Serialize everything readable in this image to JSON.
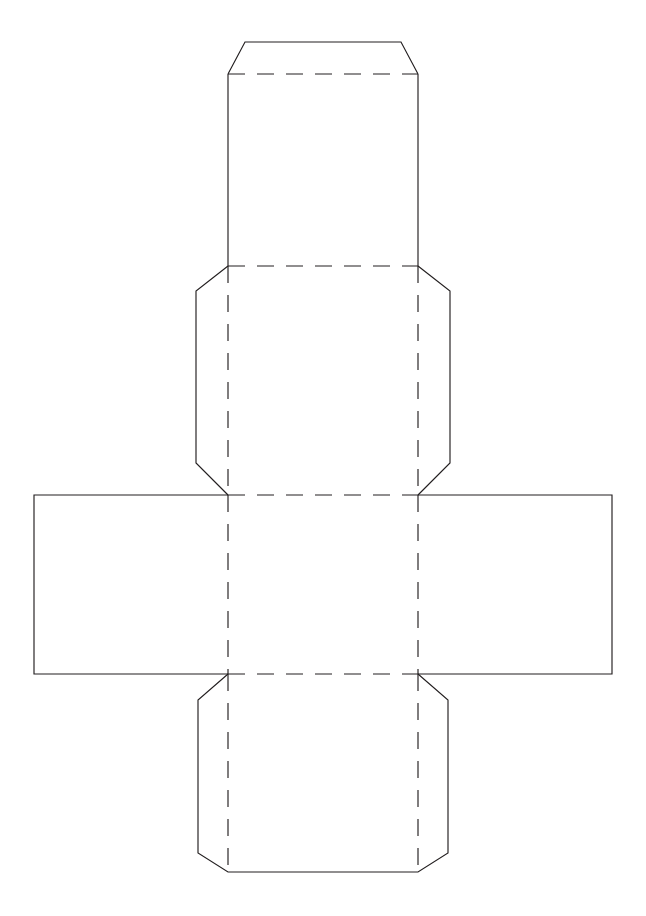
{
  "document": {
    "title": "Cube Box Papercraft Template",
    "kind": "printable-craft-net",
    "page": {
      "width": 646,
      "height": 916,
      "background": "#ffffff"
    }
  },
  "style": {
    "cut_line_color": "#231f20",
    "fold_line_color": "#231f20",
    "line_width": 1.15,
    "fold_dash_pattern": "17 12",
    "face_fill": "#ffffff"
  },
  "legend": {
    "cut_label": "Cut line (solid)",
    "fold_label": "Fold line (dashed)"
  },
  "geometry": {
    "center_column": {
      "left": 228,
      "right": 418,
      "width": 190
    },
    "middle_row": {
      "top": 495,
      "bottom": 674,
      "height": 179
    },
    "chamfer": 32
  },
  "panels": [
    {
      "id": "top-glue-flap",
      "name": "Top glue flap",
      "position": "top",
      "outline": "M228,74 L245,42 L401,42 L418,74",
      "fold": "M228,74 L418,74"
    },
    {
      "id": "top-panel",
      "name": "Top face panel",
      "position": "upper-center",
      "outline": "M228,74 L228,266 M418,74 L418,266",
      "fold": "M228,266 L418,266"
    },
    {
      "id": "upper-middle-panel",
      "name": "Upper middle face with side tabs",
      "position": "middle-upper",
      "outline": "M228,266 L196,291 L196,463 L228,495 M418,266 L450,291 L450,463 L418,495",
      "fold_vertical_left": "M228,266 L228,495",
      "fold_vertical_right": "M418,266 L418,495",
      "fold_bottom": "M228,495 L418,495"
    },
    {
      "id": "left-panel",
      "name": "Left face panel",
      "position": "middle-left",
      "outline": "M228,495 L34,495 L34,674 L228,674",
      "fold": "M228,495 L228,674"
    },
    {
      "id": "center-panel",
      "name": "Center base face",
      "position": "middle-center",
      "fold_top": "M228,495 L418,495",
      "fold_bottom": "M228,674 L418,674",
      "fold_left": "M228,495 L228,674",
      "fold_right": "M418,495 L418,674"
    },
    {
      "id": "right-panel",
      "name": "Right face panel",
      "position": "middle-right",
      "outline": "M418,495 L612,495 L612,674 L418,674",
      "fold": "M418,495 L418,674"
    },
    {
      "id": "bottom-panel",
      "name": "Bottom face with side tabs",
      "position": "lower-center",
      "outline": "M228,674 L198,700 L198,853 L228,887 L418,887 L448,853 L448,700 L418,674",
      "fold_top": "M228,674 L418,674",
      "fold_vertical_left": "M228,674 L228,887",
      "fold_vertical_right": "M418,674 L418,887"
    }
  ],
  "cut_paths": [
    "M228,74 L245,42 L401,42 L418,74",
    "M228,74 L228,266 L196,291 L196,463 L228,495 L34,495 L34,674 L228,674 L198,700 L198,853 L228,872 L418,872 L448,853 L448,700 L418,674 L612,674 L612,495 L418,495 L450,463 L450,291 L418,266 L418,74"
  ],
  "fold_paths": [
    "M228,74 L418,74",
    "M228,266 L418,266",
    "M228,495 L418,495",
    "M228,674 L418,674",
    "M228,266 L228,495",
    "M418,266 L418,495",
    "M228,495 L228,674",
    "M418,495 L418,674",
    "M228,674 L228,872",
    "M418,674 L418,872"
  ]
}
